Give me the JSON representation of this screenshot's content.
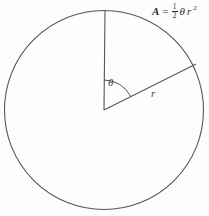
{
  "figure": {
    "kind": "geometry-diagram",
    "background_color": "#fdfdfd",
    "stroke_color": "#555555",
    "text_color": "#3c3c3c"
  },
  "labels": {
    "angle": "θ",
    "radius": "r",
    "formula_area_symbol": "A",
    "formula_equals": "=",
    "formula_numerator": "1",
    "formula_denominator": "2",
    "formula_theta": "θ",
    "formula_r": "r",
    "formula_exponent": "2",
    "formula_plain": "A = 1/2 θr²"
  },
  "geometry": {
    "circle": {
      "center_x": 104,
      "center_y": 110,
      "radius": 99.5
    },
    "vertical_radius": {
      "from_x": 104,
      "from_y": 110,
      "to_x": 105,
      "to_y": 10
    },
    "slanted_radius": {
      "from_x": 104,
      "from_y": 110,
      "to_x": 196,
      "to_y": 64,
      "angle_above_horizontal_deg": 26.5
    },
    "angle_arc": {
      "radius": 30,
      "start_deg_from_vertical": 0,
      "end_deg_from_vertical": 63.5
    }
  },
  "chart_data": {
    "type": "scatter",
    "xlabel": "",
    "ylabel": "",
    "annotations": [
      "θ",
      "r",
      "A = ½θr²"
    ]
  }
}
